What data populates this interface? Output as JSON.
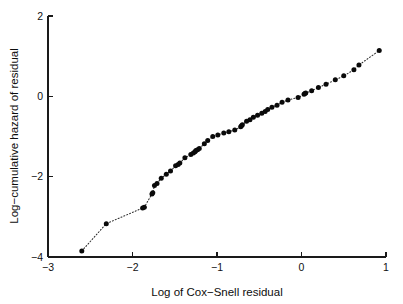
{
  "chart_data": {
    "type": "scatter",
    "title": "",
    "subtitle": "",
    "xlabel": "Log of Cox−Snell residual",
    "ylabel": "Log−cumulative hazard of residual",
    "xlim": [
      -3,
      1
    ],
    "ylim": [
      -4,
      2
    ],
    "xticks": [
      -3,
      -2,
      -1,
      0,
      1
    ],
    "xtick_labels": [
      "−3",
      "−2",
      "−1",
      "0",
      "1"
    ],
    "yticks": [
      2,
      0,
      -2,
      -4
    ],
    "ytick_labels": [
      "2",
      "0",
      "−2",
      "−4"
    ],
    "grid": false,
    "legend": null,
    "marker": "filled-circle",
    "marker_color": "#0a0a0a",
    "line_style": "dotted",
    "line_color": "#2b2b2b",
    "series": [
      {
        "name": "Cox-Snell residual diagnostic",
        "x": [
          -2.6,
          -2.31,
          -1.88,
          -1.86,
          -1.77,
          -1.76,
          -1.74,
          -1.71,
          -1.66,
          -1.6,
          -1.55,
          -1.49,
          -1.46,
          -1.44,
          -1.38,
          -1.31,
          -1.28,
          -1.26,
          -1.25,
          -1.23,
          -1.21,
          -1.15,
          -1.11,
          -1.05,
          -0.99,
          -0.92,
          -0.86,
          -0.79,
          -0.72,
          -0.71,
          -0.7,
          -0.65,
          -0.61,
          -0.57,
          -0.52,
          -0.47,
          -0.43,
          -0.4,
          -0.35,
          -0.29,
          -0.23,
          -0.16,
          -0.04,
          0.03,
          0.04,
          0.05,
          0.12,
          0.2,
          0.29,
          0.4,
          0.5,
          0.62,
          0.68,
          0.92
        ],
        "y": [
          -3.85,
          -3.17,
          -2.78,
          -2.76,
          -2.43,
          -2.4,
          -2.22,
          -2.17,
          -2.04,
          -1.94,
          -1.86,
          -1.73,
          -1.7,
          -1.66,
          -1.53,
          -1.45,
          -1.41,
          -1.38,
          -1.35,
          -1.33,
          -1.3,
          -1.18,
          -1.1,
          -1.0,
          -0.96,
          -0.91,
          -0.88,
          -0.84,
          -0.76,
          -0.73,
          -0.71,
          -0.62,
          -0.58,
          -0.52,
          -0.47,
          -0.42,
          -0.38,
          -0.33,
          -0.27,
          -0.22,
          -0.15,
          -0.09,
          -0.03,
          0.05,
          0.07,
          0.08,
          0.14,
          0.22,
          0.3,
          0.41,
          0.51,
          0.66,
          0.78,
          1.14
        ]
      }
    ]
  },
  "axes": {
    "x_title": "Log of Cox−Snell residual",
    "y_title": "Log−cumulative hazard of residual"
  }
}
